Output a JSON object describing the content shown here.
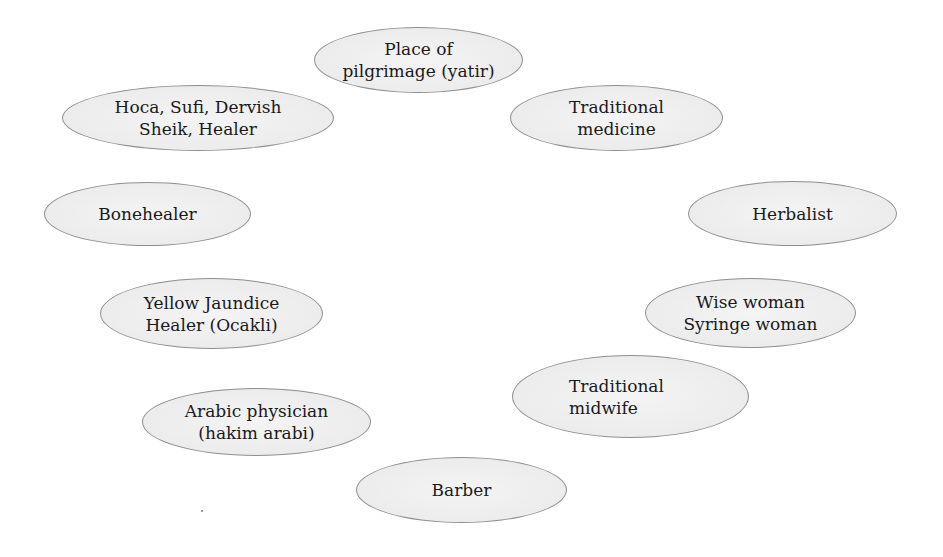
{
  "diagram": {
    "title": "",
    "nodes": [
      {
        "id": "pilgrimage",
        "lines": [
          "Place of",
          "pilgrimage (yatir)"
        ]
      },
      {
        "id": "hoca",
        "lines": [
          "Hoca, Sufi, Dervish",
          "Sheik, Healer"
        ]
      },
      {
        "id": "traditional-medicine",
        "lines": [
          "Traditional",
          "medicine"
        ]
      },
      {
        "id": "bonehealer",
        "lines": [
          "Bonehealer"
        ]
      },
      {
        "id": "herbalist",
        "lines": [
          "Herbalist"
        ]
      },
      {
        "id": "yellow-jaundice",
        "lines": [
          "Yellow Jaundice",
          "Healer (Ocakli)"
        ]
      },
      {
        "id": "wise-woman",
        "lines": [
          "Wise woman",
          "Syringe woman"
        ]
      },
      {
        "id": "traditional-midwife",
        "lines": [
          "Traditional",
          "midwife"
        ]
      },
      {
        "id": "arabic-physician",
        "lines": [
          "Arabic physician",
          "(hakim arabi)"
        ]
      },
      {
        "id": "barber",
        "lines": [
          "Barber"
        ]
      }
    ],
    "colors": {
      "node_fill": "#ececec",
      "node_border": "#8f8f8f",
      "text": "#1a1a1a",
      "background": "#ffffff"
    }
  }
}
